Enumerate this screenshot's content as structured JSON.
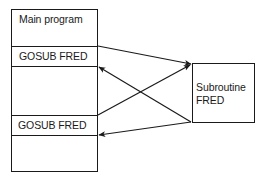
{
  "diagram": {
    "type": "control-flow",
    "main_program": {
      "title": "Main program",
      "rows": [
        {
          "label": "GOSUB FRED"
        },
        {
          "label": "GOSUB FRED"
        }
      ]
    },
    "subroutine": {
      "title_line1": "Subroutine",
      "title_line2": "FRED"
    },
    "edges": [
      {
        "from": "GOSUB FRED (1)",
        "to": "Subroutine FRED",
        "kind": "call"
      },
      {
        "from": "GOSUB FRED (2)",
        "to": "Subroutine FRED",
        "kind": "call"
      },
      {
        "from": "Subroutine FRED",
        "to": "after GOSUB FRED (1)",
        "kind": "return"
      },
      {
        "from": "Subroutine FRED",
        "to": "after GOSUB FRED (2)",
        "kind": "return"
      }
    ],
    "colors": {
      "stroke": "#1a1a1a",
      "background": "#ffffff"
    }
  }
}
